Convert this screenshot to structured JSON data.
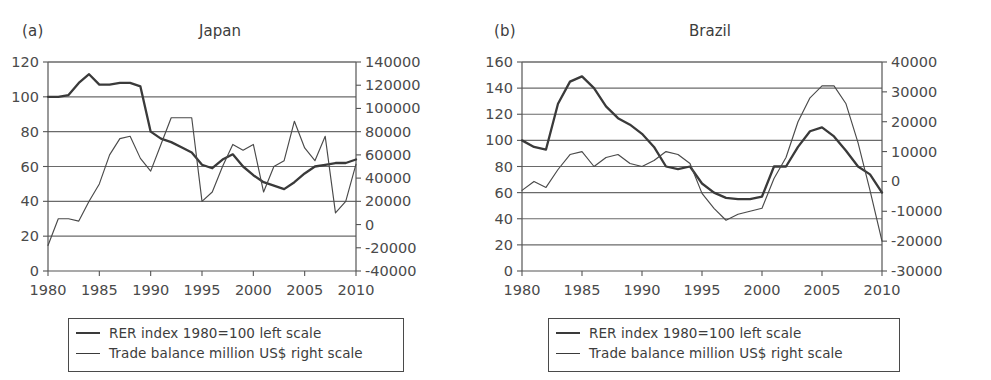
{
  "figure": {
    "background": "#ffffff",
    "line_color": "#3a3a3a",
    "grid_color": "#6a6a6a"
  },
  "panels": [
    {
      "label": "(a)",
      "title": "Japan",
      "legend": [
        {
          "style": "thick",
          "text": "RER index 1980=100 left scale"
        },
        {
          "style": "thin",
          "text": "Trade balance million US$ right scale"
        }
      ]
    },
    {
      "label": "(b)",
      "title": "Brazil",
      "legend": [
        {
          "style": "thick",
          "text": "RER index 1980=100 left scale"
        },
        {
          "style": "thin",
          "text": "Trade balance million US$ right scale"
        }
      ]
    }
  ],
  "chart_data": [
    {
      "type": "line",
      "title": "Japan",
      "panel_label": "(a)",
      "xlabel": "",
      "ylabel": "",
      "grid": true,
      "legend_position": "below",
      "x": [
        1980,
        1981,
        1982,
        1983,
        1984,
        1985,
        1986,
        1987,
        1988,
        1989,
        1990,
        1991,
        1992,
        1993,
        1994,
        1995,
        1996,
        1997,
        1998,
        1999,
        2000,
        2001,
        2002,
        2003,
        2004,
        2005,
        2006,
        2007,
        2008,
        2009,
        2010
      ],
      "xlim": [
        1980,
        2010
      ],
      "xticks": [
        1980,
        1985,
        1990,
        1995,
        2000,
        2005,
        2010
      ],
      "left_axis": {
        "label": "RER index 1980=100 left scale",
        "ylim": [
          0,
          120
        ],
        "yticks": [
          0,
          20,
          40,
          60,
          80,
          100,
          120
        ]
      },
      "right_axis": {
        "label": "Trade balance million US$ right scale",
        "ylim": [
          -40000,
          140000
        ],
        "yticks": [
          -40000,
          -20000,
          0,
          20000,
          40000,
          60000,
          80000,
          100000,
          120000,
          140000
        ]
      },
      "series": [
        {
          "name": "RER index 1980=100 left scale",
          "axis": "left",
          "style": "thick",
          "values": [
            100,
            100,
            101,
            108,
            113,
            107,
            107,
            108,
            108,
            106,
            80,
            76,
            74,
            71,
            68,
            61,
            59,
            64,
            67,
            60,
            55,
            51,
            49,
            47,
            51,
            56,
            60,
            61,
            62,
            62,
            64
          ]
        },
        {
          "name": "Trade balance million US$ right scale",
          "axis": "right",
          "style": "thin",
          "values": [
            -18000,
            5000,
            5000,
            3000,
            20000,
            35000,
            60000,
            74000,
            76000,
            57000,
            46000,
            69000,
            92000,
            92000,
            92000,
            20000,
            28000,
            50000,
            69000,
            64000,
            69000,
            28000,
            50000,
            55000,
            89000,
            66000,
            55000,
            76000,
            10000,
            20000,
            52000
          ]
        }
      ]
    },
    {
      "type": "line",
      "title": "Brazil",
      "panel_label": "(b)",
      "xlabel": "",
      "ylabel": "",
      "grid": true,
      "legend_position": "below",
      "x": [
        1980,
        1981,
        1982,
        1983,
        1984,
        1985,
        1986,
        1987,
        1988,
        1989,
        1990,
        1991,
        1992,
        1993,
        1994,
        1995,
        1996,
        1997,
        1998,
        1999,
        2000,
        2001,
        2002,
        2003,
        2004,
        2005,
        2006,
        2007,
        2008,
        2009,
        2010
      ],
      "xlim": [
        1980,
        2010
      ],
      "xticks": [
        1980,
        1985,
        1990,
        1995,
        2000,
        2005,
        2010
      ],
      "left_axis": {
        "label": "RER index 1980=100 left scale",
        "ylim": [
          0,
          160
        ],
        "yticks": [
          0,
          20,
          40,
          60,
          80,
          100,
          120,
          140,
          160
        ]
      },
      "right_axis": {
        "label": "Trade balance million US$ right scale",
        "ylim": [
          -30000,
          40000
        ],
        "yticks": [
          -30000,
          -20000,
          -10000,
          0,
          10000,
          20000,
          30000,
          40000
        ]
      },
      "series": [
        {
          "name": "RER index 1980=100 left scale",
          "axis": "left",
          "style": "thick",
          "values": [
            100,
            95,
            93,
            128,
            145,
            149,
            140,
            126,
            117,
            112,
            105,
            95,
            80,
            78,
            80,
            67,
            60,
            56,
            55,
            55,
            57,
            80,
            80,
            95,
            107,
            110,
            103,
            92,
            80,
            74,
            60
          ]
        },
        {
          "name": "Trade balance million US$ right scale",
          "axis": "right",
          "style": "thin",
          "values": [
            -3000,
            0,
            -2000,
            4000,
            9000,
            10000,
            5000,
            8000,
            9000,
            6000,
            5000,
            7000,
            10000,
            9000,
            6000,
            -4000,
            -9000,
            -13000,
            -11000,
            -10000,
            -9000,
            1000,
            8000,
            20000,
            28000,
            32000,
            32000,
            26000,
            13000,
            -3000,
            -20000
          ]
        }
      ]
    }
  ]
}
